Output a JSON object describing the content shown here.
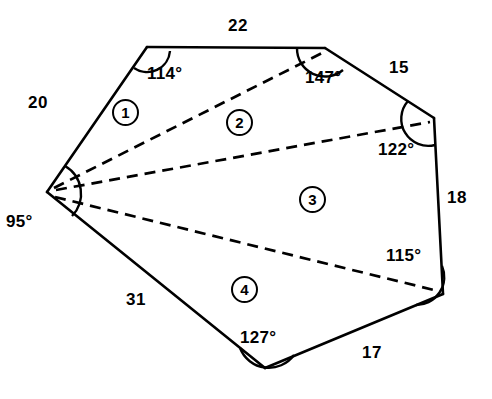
{
  "figure": {
    "stroke_color": "#000000",
    "background_color": "#ffffff"
  },
  "vertices": [
    {
      "id": "A",
      "name": "left-vertex",
      "x": 47,
      "y": 192
    },
    {
      "id": "B",
      "name": "top-left-vertex",
      "x": 147,
      "y": 47
    },
    {
      "id": "C",
      "name": "top-right-vertex",
      "x": 325,
      "y": 48
    },
    {
      "id": "D",
      "name": "right-upper-vertex",
      "x": 434,
      "y": 118
    },
    {
      "id": "E",
      "name": "right-lower-vertex",
      "x": 443,
      "y": 294
    },
    {
      "id": "F",
      "name": "bottom-vertex",
      "x": 265,
      "y": 368
    }
  ],
  "sides": [
    {
      "id": "AB",
      "label": "20",
      "x": 38,
      "y": 93
    },
    {
      "id": "BC",
      "label": "22",
      "x": 228,
      "y": 16
    },
    {
      "id": "CD",
      "label": "15",
      "x": 389,
      "y": 58
    },
    {
      "id": "DE",
      "label": "18",
      "x": 447,
      "y": 188
    },
    {
      "id": "EF",
      "label": "17",
      "x": 362,
      "y": 343
    },
    {
      "id": "FA",
      "label": "31",
      "x": 126,
      "y": 290
    }
  ],
  "angles": [
    {
      "at": "A",
      "label": "95°",
      "x": 14,
      "y": 212
    },
    {
      "at": "B",
      "label": "114°",
      "x": 153,
      "y": 64
    },
    {
      "at": "C",
      "label": "147°",
      "x": 307,
      "y": 68
    },
    {
      "at": "D",
      "label": "122°",
      "x": 381,
      "y": 140
    },
    {
      "at": "E",
      "label": "115°",
      "x": 389,
      "y": 246
    },
    {
      "at": "F",
      "label": "127°",
      "x": 245,
      "y": 328
    }
  ],
  "regions": [
    {
      "label": "1",
      "x": 126,
      "y": 113,
      "triangle": "A-B-C"
    },
    {
      "label": "2",
      "x": 240,
      "y": 123,
      "triangle": "A-C-D"
    },
    {
      "label": "3",
      "x": 313,
      "y": 200,
      "triangle": "A-D-E"
    },
    {
      "label": "4",
      "x": 245,
      "y": 290,
      "triangle": "A-E-F"
    }
  ],
  "diagonals": [
    {
      "id": "AC",
      "from": "A",
      "to": "C"
    },
    {
      "id": "AD",
      "from": "A",
      "to": "D"
    },
    {
      "id": "AE",
      "from": "A",
      "to": "E"
    }
  ]
}
